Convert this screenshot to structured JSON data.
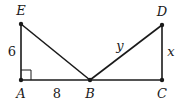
{
  "diagram": {
    "points": {
      "E": {
        "label": "E",
        "x": 21,
        "y": 24
      },
      "A": {
        "label": "A",
        "x": 21,
        "y": 80
      },
      "B": {
        "label": "B",
        "x": 90,
        "y": 80
      },
      "C": {
        "label": "C",
        "x": 162,
        "y": 80
      },
      "D": {
        "label": "D",
        "x": 162,
        "y": 25
      }
    },
    "segments": [
      {
        "from": "E",
        "to": "A",
        "label": "6"
      },
      {
        "from": "A",
        "to": "B",
        "label": "8"
      },
      {
        "from": "B",
        "to": "C",
        "label": ""
      },
      {
        "from": "E",
        "to": "B",
        "label": ""
      },
      {
        "from": "B",
        "to": "D",
        "label": "y"
      },
      {
        "from": "D",
        "to": "C",
        "label": "x"
      }
    ],
    "labels": {
      "EA": "6",
      "AB": "8",
      "BD": "y",
      "DC": "x"
    },
    "right_angle_at": "A",
    "colors": {
      "stroke": "#1a1a1a",
      "background": "#ffffff"
    }
  }
}
